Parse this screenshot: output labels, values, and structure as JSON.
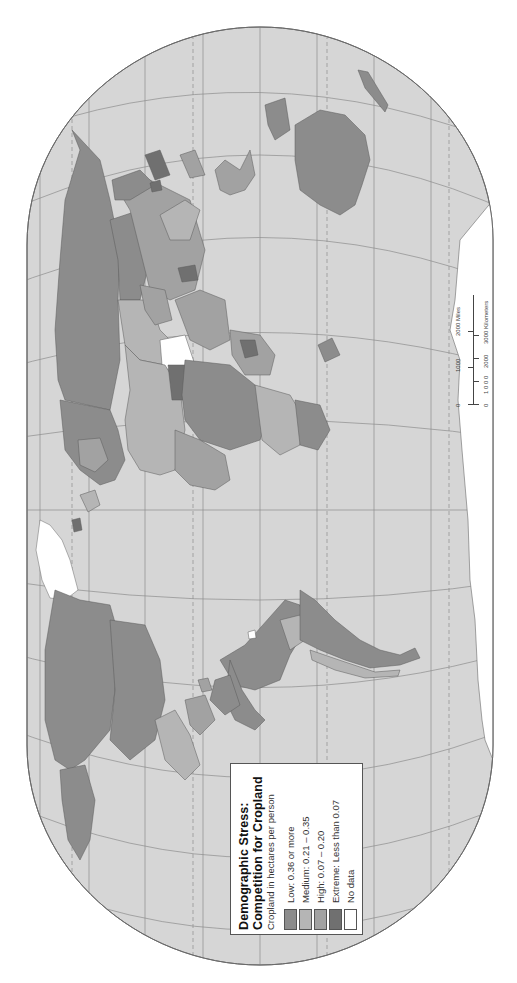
{
  "map": {
    "projection_orientation": "rotated 90 degrees counter-clockwise",
    "colors": {
      "ocean": "#d6d6d6",
      "graticule": "#8c8c8c",
      "outline": "#6a6a6a",
      "low": "#8c8c8c",
      "medium": "#b5b5b5",
      "high": "#a2a2a2",
      "extreme": "#707070",
      "no_data": "#ffffff",
      "border": "#5a5a5a"
    }
  },
  "legend": {
    "title_line1": "Demographic Stress:",
    "title_line2": "Competition for Cropland",
    "subtitle": "Cropland in hectares per person",
    "items": [
      {
        "label": "Low:  0.36 or more",
        "color": "#8c8c8c"
      },
      {
        "label": "Medium:  0.21 – 0.35",
        "color": "#b5b5b5"
      },
      {
        "label": "High:  0.07 – 0.20",
        "color": "#a2a2a2"
      },
      {
        "label": "Extreme:  Less than 0.07",
        "color": "#707070"
      },
      {
        "label": "No data",
        "color": "#ffffff"
      }
    ]
  },
  "scale_bar": {
    "miles_ticks": [
      "0",
      "1000",
      "2000 Miles"
    ],
    "km_ticks": [
      "0",
      "1 0 0 0",
      "2000",
      "3000 Kilometers"
    ]
  }
}
